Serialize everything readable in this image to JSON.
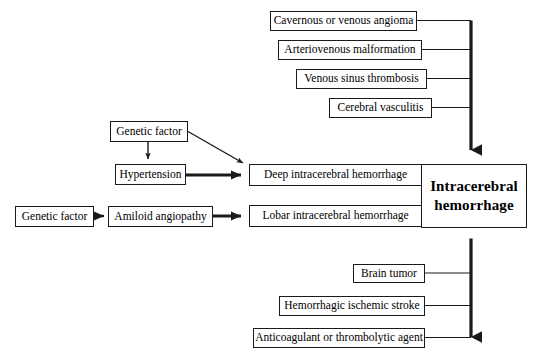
{
  "diagram": {
    "center": {
      "label": "Intracerebral hemorrhage",
      "line1": "Intracerebral",
      "line2": "hemorrhage"
    },
    "top_causes": [
      {
        "label": "Cavernous or venous angioma"
      },
      {
        "label": "Arteriovenous malformation"
      },
      {
        "label": "Venous sinus thrombosis"
      },
      {
        "label": "Cerebral vasculitis"
      }
    ],
    "middle_outcomes": [
      {
        "label": "Deep intracerebral hemorrhage"
      },
      {
        "label": "Lobar intracerebral hemorrhage"
      }
    ],
    "left_factors": [
      {
        "label": "Genetic factor"
      },
      {
        "label": "Hypertension"
      },
      {
        "label": "Genetic factor"
      },
      {
        "label": "Amiloid angiopathy"
      }
    ],
    "bottom_causes": [
      {
        "label": "Brain tumor"
      },
      {
        "label": "Hemorrhagic ischemic stroke"
      },
      {
        "label": "Anticoagulant or thrombolytic agent"
      }
    ],
    "colors": {
      "stroke": "#1a1a1a",
      "background": "#ffffff",
      "text": "#000000"
    }
  }
}
